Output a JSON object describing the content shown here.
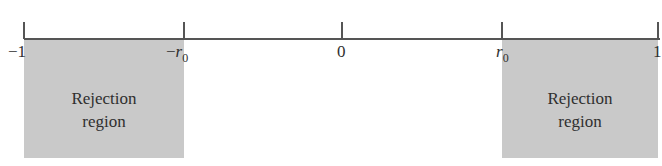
{
  "diagram": {
    "type": "number-line",
    "axis": {
      "min": -1,
      "max": 1,
      "ticks": [
        {
          "id": "neg-one",
          "sign": "−",
          "main": "1",
          "sub": ""
        },
        {
          "id": "neg-r0",
          "sign": "−",
          "main": "r",
          "sub": "0"
        },
        {
          "id": "zero",
          "sign": "",
          "main": "0",
          "sub": ""
        },
        {
          "id": "r0",
          "sign": "",
          "main": "r",
          "sub": "0"
        },
        {
          "id": "one",
          "sign": "",
          "main": "1",
          "sub": ""
        }
      ]
    },
    "regions": [
      {
        "id": "left",
        "from": "-1",
        "to": "-r0",
        "line1": "Rejection",
        "line2": "region",
        "color": "#c9c9c9"
      },
      {
        "id": "right",
        "from": "r0",
        "to": "1",
        "line1": "Rejection",
        "line2": "region",
        "color": "#c9c9c9"
      }
    ]
  }
}
